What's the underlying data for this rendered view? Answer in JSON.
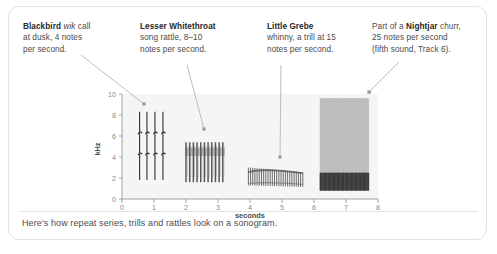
{
  "card": {
    "caption": "Here's how repeat series, trills and rattles look on a sonogram."
  },
  "callouts": [
    {
      "id": "blackbird",
      "species": "Blackbird",
      "italic": "wik",
      "rest_line1": " call",
      "line2": "at dusk, 4 notes",
      "line3": "per second."
    },
    {
      "id": "whitethroat",
      "species": "Lesser Whitethroat",
      "line2": "song rattle, 8–10",
      "line3": "notes per second."
    },
    {
      "id": "grebe",
      "species": "Little Grebe",
      "line2": "whinny, a trill at 15",
      "line3": "notes per second."
    },
    {
      "id": "nightjar",
      "prefix": "Part of a ",
      "species": "Nightjar",
      "rest_line1": " churr,",
      "line2": "25 notes per second",
      "line3": "(fifth sound, Track 6)."
    }
  ],
  "chart_data": {
    "type": "heatmap",
    "title": "",
    "xlabel": "seconds",
    "ylabel": "kHz",
    "xlim": [
      0,
      8
    ],
    "ylim": [
      0,
      10
    ],
    "xticks": [
      0,
      1,
      2,
      3,
      4,
      5,
      6,
      7,
      8
    ],
    "xticklabels": [
      "0",
      "1",
      "2",
      "3",
      "4",
      "5",
      "6",
      "7",
      "8"
    ],
    "yticks": [
      0,
      2,
      4,
      6,
      8,
      10
    ],
    "yticklabels": [
      "0",
      "2",
      "4",
      "6",
      "8",
      "10"
    ],
    "grid": false,
    "legend": "none",
    "series": [
      {
        "name": "Blackbird wik call",
        "kind": "repeat-series",
        "notes": 4,
        "rate_per_second": 4,
        "x_start": 0.55,
        "x_end": 1.3,
        "freq_low": 1.8,
        "freq_high": 8.3,
        "note_times": [
          0.55,
          0.78,
          1.03,
          1.28
        ]
      },
      {
        "name": "Lesser Whitethroat song rattle",
        "kind": "rattle",
        "rate_per_second": 9,
        "x_start": 2.0,
        "x_end": 3.15,
        "freq_low": 1.6,
        "freq_high": 5.4,
        "note_count": 11
      },
      {
        "name": "Little Grebe whinny trill",
        "kind": "trill",
        "rate_per_second": 15,
        "x_start": 3.95,
        "x_end": 5.65,
        "freq_low": 1.3,
        "freq_high": 3.0,
        "note_count": 26
      },
      {
        "name": "Nightjar churr",
        "kind": "churr",
        "rate_per_second": 25,
        "x_start": 6.2,
        "x_end": 7.7,
        "freq_low": 0.8,
        "freq_high": 9.6,
        "note_count": 38
      }
    ],
    "annotation_anchors": [
      {
        "series": "Blackbird wik call",
        "x": 0.72,
        "y": 9.0
      },
      {
        "series": "Lesser Whitethroat song rattle",
        "x": 2.55,
        "y": 6.3
      },
      {
        "series": "Little Grebe whinny trill",
        "x": 4.95,
        "y": 4.0
      },
      {
        "series": "Nightjar churr",
        "x": 7.55,
        "y": 10.6
      }
    ]
  }
}
